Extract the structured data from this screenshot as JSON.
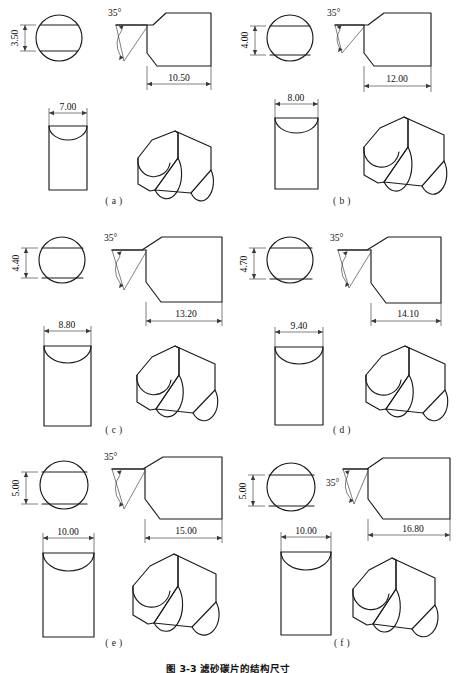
{
  "figure": {
    "caption": "图 3-3  滤砂碳片的结构尺寸",
    "caption_visible_fragment": "图 3-3 滤砂碳片的结构尺寸",
    "sheet_width": 456,
    "sheet_height": 673,
    "background_color": "#ffffff",
    "line_color": "#1a1a1a",
    "dimension_line_color": "#3a3a3a"
  },
  "common": {
    "angle_label": "35°",
    "views": {
      "top": "top-view-circle",
      "front": "front-view-profile",
      "side": "side-view-rectangle",
      "pictorial": "isometric-pictorial"
    }
  },
  "panels": [
    {
      "key": "a",
      "label": "( a )",
      "angle": "35°",
      "height_dim": "3.50",
      "width_dim": "7.00",
      "length_dim": "10.50",
      "angle_label_side": "right"
    },
    {
      "key": "b",
      "label": "( b )",
      "angle": "35°",
      "height_dim": "4.00",
      "width_dim": "8.00",
      "length_dim": "12.00",
      "angle_label_side": "right"
    },
    {
      "key": "c",
      "label": "( c )",
      "angle": "35°",
      "height_dim": "4.40",
      "width_dim": "8.80",
      "length_dim": "13.20",
      "angle_label_side": "right"
    },
    {
      "key": "d",
      "label": "( d )",
      "angle": "35°",
      "height_dim": "4.70",
      "width_dim": "9.40",
      "length_dim": "14.10",
      "angle_label_side": "right"
    },
    {
      "key": "e",
      "label": "( e )",
      "angle": "35°",
      "height_dim": "5.00",
      "width_dim": "10.00",
      "length_dim": "15.00",
      "angle_label_side": "right"
    },
    {
      "key": "f",
      "label": "( f )",
      "angle": "35°",
      "height_dim": "5.00",
      "width_dim": "10.00",
      "length_dim": "16.80",
      "angle_label_side": "left"
    }
  ]
}
